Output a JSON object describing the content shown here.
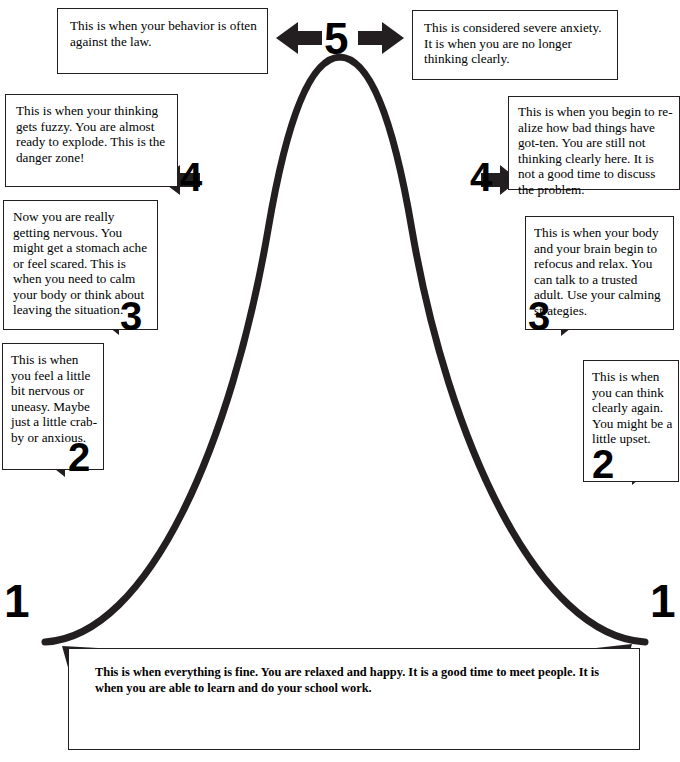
{
  "diagram": {
    "ink_color": "#231f20",
    "background": "#ffffff",
    "levels": [
      "1",
      "2",
      "3",
      "4",
      "5"
    ]
  },
  "numerals": {
    "five": "5",
    "four_left": "4",
    "four_right": "4",
    "three_left": "3",
    "three_right": "3",
    "two_left": "2",
    "two_right": "2",
    "one_left": "1",
    "one_right": "1"
  },
  "boxes": {
    "level5_left": {
      "level": "5",
      "side": "left",
      "text": "This is when your behavior is often against the law."
    },
    "level5_right": {
      "level": "5",
      "side": "right",
      "text": "This is considered severe anxiety.  It is when you are no longer thinking clearly."
    },
    "level4_left": {
      "level": "4",
      "side": "left",
      "text": "This is when your thinking gets fuzzy.  You are almost ready to explode.  This is the danger zone!"
    },
    "level4_right": {
      "level": "4",
      "side": "right",
      "text": "This is when you begin to re-alize how bad things have got-ten.  You are still not thinking clearly here.  It is not a good time to discuss the problem."
    },
    "level3_left": {
      "level": "3",
      "side": "left",
      "text": "Now you are really getting nervous.  You might get a stomach ache or feel scared.  This is when you need to calm your body or think about leaving the situation."
    },
    "level3_right": {
      "level": "3",
      "side": "right",
      "text": "This is when your body and your brain begin to refocus and relax.  You can talk to a trusted adult.  Use your calming strategies."
    },
    "level2_left": {
      "level": "2",
      "side": "left",
      "text": "This is when you feel a little bit nervous or uneasy.  Maybe just a little crab-by or anxious."
    },
    "level2_right": {
      "level": "2",
      "side": "right",
      "text": "This is when you can think clearly again. You might be a little upset."
    },
    "level1_bottom": {
      "level": "1",
      "side": "bottom",
      "text": "This is when everything is fine. You are relaxed and happy.  It is a good time to meet people. It is when you are able to learn and do your school work."
    }
  },
  "arrows": {
    "apex_left": "arrow-left-icon",
    "apex_right": "arrow-right-icon",
    "level4_left": "arrow-left-icon",
    "level4_right": "arrow-right-icon",
    "level3_left": "arrow-left-icon",
    "level3_right": "arrow-right-icon",
    "level2_left": "arrow-left-icon",
    "level2_right": "arrow-right-icon",
    "baseline_left": "arrow-up-left-icon",
    "baseline_right": "arrow-up-right-icon"
  }
}
